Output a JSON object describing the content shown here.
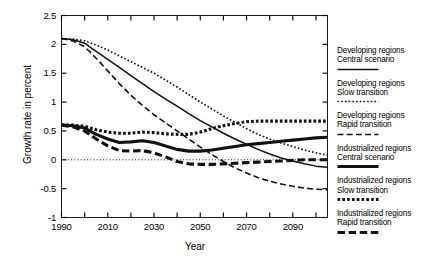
{
  "chart_data": {
    "type": "line",
    "title": "",
    "xlabel": "Year",
    "ylabel": "Growth rate in percent",
    "xlim": [
      1990,
      2105
    ],
    "ylim": [
      -1,
      2.5
    ],
    "grid": false,
    "legend_position": "right",
    "xticks": [
      "1990",
      "2010",
      "2030",
      "2050",
      "2070",
      "2090"
    ],
    "xtick_values": [
      1990,
      2010,
      2030,
      2050,
      2070,
      2090
    ],
    "xminor_values": [
      2000,
      2020,
      2040,
      2060,
      2080,
      2100
    ],
    "yticks": [
      "2.5",
      "2",
      "1.5",
      "1",
      "0.5",
      "0",
      "-0.5",
      "-1"
    ],
    "ytick_values": [
      2.5,
      2,
      1.5,
      1,
      0.5,
      0,
      -0.5,
      -1
    ],
    "zero_line": 0,
    "x": [
      1990,
      1995,
      2000,
      2005,
      2010,
      2015,
      2020,
      2025,
      2030,
      2035,
      2040,
      2045,
      2050,
      2055,
      2060,
      2065,
      2070,
      2075,
      2080,
      2085,
      2090,
      2095,
      2100,
      2105
    ],
    "series": [
      {
        "name": "Developing regions Central scenario",
        "style": "thin-solid",
        "values": [
          2.1,
          2.08,
          2.02,
          1.88,
          1.74,
          1.6,
          1.46,
          1.32,
          1.18,
          1.05,
          0.93,
          0.8,
          0.68,
          0.57,
          0.46,
          0.36,
          0.27,
          0.18,
          0.1,
          0.03,
          -0.02,
          -0.07,
          -0.11,
          -0.13
        ]
      },
      {
        "name": "Developing regions Slow transition",
        "style": "thin-dotted",
        "values": [
          2.1,
          2.09,
          2.06,
          1.99,
          1.9,
          1.8,
          1.7,
          1.6,
          1.5,
          1.38,
          1.26,
          1.13,
          1.0,
          0.88,
          0.76,
          0.65,
          0.54,
          0.44,
          0.36,
          0.29,
          0.23,
          0.17,
          0.12,
          0.08
        ]
      },
      {
        "name": "Developing regions Rapid transition",
        "style": "thin-dashed",
        "values": [
          2.1,
          2.06,
          1.96,
          1.76,
          1.54,
          1.32,
          1.12,
          0.94,
          0.78,
          0.64,
          0.5,
          0.36,
          0.22,
          0.09,
          -0.03,
          -0.14,
          -0.23,
          -0.31,
          -0.37,
          -0.42,
          -0.46,
          -0.49,
          -0.51,
          -0.52
        ]
      },
      {
        "name": "Industrialized regions Central scenario",
        "style": "thick-solid",
        "values": [
          0.6,
          0.59,
          0.55,
          0.44,
          0.36,
          0.3,
          0.31,
          0.33,
          0.3,
          0.24,
          0.18,
          0.15,
          0.15,
          0.17,
          0.2,
          0.23,
          0.26,
          0.28,
          0.3,
          0.32,
          0.34,
          0.36,
          0.38,
          0.39
        ]
      },
      {
        "name": "Industrialized regions Slow transition",
        "style": "thick-dotted",
        "values": [
          0.6,
          0.6,
          0.58,
          0.52,
          0.48,
          0.46,
          0.46,
          0.48,
          0.47,
          0.45,
          0.44,
          0.44,
          0.48,
          0.54,
          0.59,
          0.63,
          0.66,
          0.67,
          0.67,
          0.67,
          0.67,
          0.67,
          0.67,
          0.67
        ]
      },
      {
        "name": "Industrialized regions Rapid transition",
        "style": "thick-dashed",
        "values": [
          0.6,
          0.57,
          0.5,
          0.36,
          0.24,
          0.16,
          0.15,
          0.16,
          0.12,
          0.05,
          -0.03,
          -0.07,
          -0.08,
          -0.08,
          -0.07,
          -0.06,
          -0.05,
          -0.04,
          -0.03,
          -0.02,
          -0.01,
          0.0,
          0.0,
          0.0
        ]
      }
    ]
  },
  "axis": {
    "ylabel": "Growth rate in percent",
    "xlabel": "Year"
  },
  "legend": {
    "items": [
      {
        "line1": "Developing regions",
        "line2": "Central scenario",
        "style": "thin-solid"
      },
      {
        "line1": "Developing regions",
        "line2": "Slow transition",
        "style": "thin-dotted"
      },
      {
        "line1": "Developing regions",
        "line2": "Rapid transition",
        "style": "thin-dashed"
      },
      {
        "line1": "Industrialized regions",
        "line2": "Central scenario",
        "style": "thick-solid"
      },
      {
        "line1": "Industrialized regions",
        "line2": "Slow transition",
        "style": "thick-dotted"
      },
      {
        "line1": "Industrialized regions",
        "line2": "Rapid transition",
        "style": "thick-dashed"
      }
    ]
  },
  "colors": {
    "ink": "#111111",
    "background": "#ffffff"
  }
}
